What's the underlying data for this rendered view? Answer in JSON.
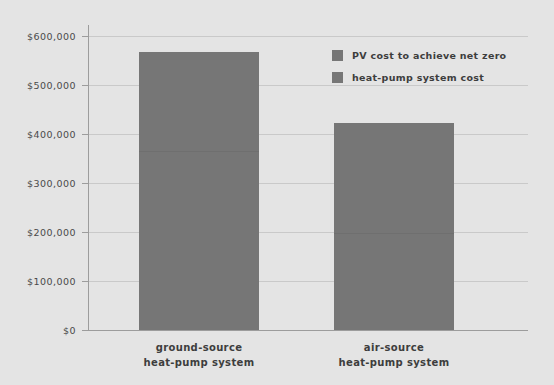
{
  "chart_data": {
    "type": "bar",
    "subtype": "stacked",
    "title": "",
    "subtitle": "",
    "xlabel": "",
    "ylabel": "",
    "categories": [
      "ground-source\nheat-pump system",
      "air-source\nheat-pump system"
    ],
    "category_lines": [
      [
        "ground-source",
        "heat-pump system"
      ],
      [
        "air-source",
        "heat-pump system"
      ]
    ],
    "series": [
      {
        "name": "heat-pump system cost",
        "values": [
          365000,
          198000
        ]
      },
      {
        "name": "PV cost to achieve net zero",
        "values": [
          202000,
          224000
        ]
      }
    ],
    "totals": [
      567000,
      422000
    ],
    "ylim": [
      0,
      620000
    ],
    "yticks": [
      0,
      100000,
      200000,
      300000,
      400000,
      500000,
      600000
    ],
    "ytick_labels": [
      "$0",
      "$100,000",
      "$200,000",
      "$300,000",
      "$400,000",
      "$500,000",
      "$600,000"
    ],
    "grid": true,
    "legend_position": "upper right"
  },
  "legend": {
    "entries": [
      {
        "label": "PV cost to achieve net zero",
        "color": "#767676"
      },
      {
        "label": "heat-pump system cost",
        "color": "#767676"
      }
    ]
  },
  "colors": {
    "background": "#e4e4e4",
    "bar": "#767676",
    "gridline": "#c9c9c9",
    "axis": "#9c9c9c",
    "text": "#3d3d3d",
    "tick_text": "#4a4a4a"
  }
}
